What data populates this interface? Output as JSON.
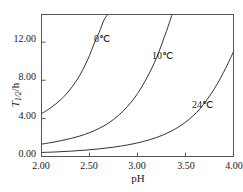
{
  "chart_data": {
    "type": "line",
    "title": "",
    "xlabel": "pH",
    "ylabel": "T1/2/h",
    "ylabel_main": "T",
    "ylabel_sub": "1/2",
    "ylabel_unit": "/h",
    "xlim": [
      2.0,
      4.0
    ],
    "ylim": [
      0.0,
      14.9
    ],
    "xticks": [
      "2.00",
      "2.50",
      "3.00",
      "3.50",
      "4.00"
    ],
    "xtick_values": [
      2.0,
      2.5,
      3.0,
      3.5,
      4.0
    ],
    "yticks": [
      "0.00",
      "4.00",
      "8.00",
      "12.00"
    ],
    "ytick_values": [
      0.0,
      4.0,
      8.0,
      12.0
    ],
    "grid": false,
    "legend_position": "inline-annotations",
    "line_color": "#333333",
    "axis_color": "#555555",
    "series": [
      {
        "name": "0℃",
        "label": "0℃",
        "label_x": 2.66,
        "label_y": 12.6,
        "x": [
          2.0,
          2.05,
          2.1,
          2.15,
          2.2,
          2.25,
          2.3,
          2.35,
          2.4,
          2.45,
          2.5,
          2.55,
          2.6,
          2.65,
          2.69
        ],
        "values": [
          4.5,
          4.8,
          5.14,
          5.52,
          5.96,
          6.47,
          7.06,
          7.74,
          8.55,
          9.5,
          10.6,
          11.9,
          13.0,
          14.3,
          14.9
        ]
      },
      {
        "name": "10℃",
        "label": "10℃",
        "label_x": 3.32,
        "label_y": 11.7,
        "x": [
          2.0,
          2.1,
          2.2,
          2.3,
          2.4,
          2.5,
          2.6,
          2.7,
          2.8,
          2.9,
          3.0,
          3.1,
          3.2,
          3.3,
          3.36
        ],
        "values": [
          1.3,
          1.46,
          1.65,
          1.88,
          2.15,
          2.5,
          2.95,
          3.52,
          4.3,
          5.3,
          6.6,
          8.3,
          10.4,
          13.1,
          14.9
        ]
      },
      {
        "name": "24℃",
        "label": "24℃",
        "label_x": 3.72,
        "label_y": 6.9,
        "x": [
          2.0,
          2.15,
          2.3,
          2.45,
          2.6,
          2.75,
          2.9,
          3.05,
          3.2,
          3.35,
          3.5,
          3.65,
          3.8,
          3.92,
          4.0
        ],
        "values": [
          0.42,
          0.48,
          0.56,
          0.66,
          0.8,
          0.98,
          1.22,
          1.55,
          2.0,
          2.65,
          3.6,
          5.0,
          7.1,
          9.3,
          11.0
        ]
      }
    ]
  }
}
